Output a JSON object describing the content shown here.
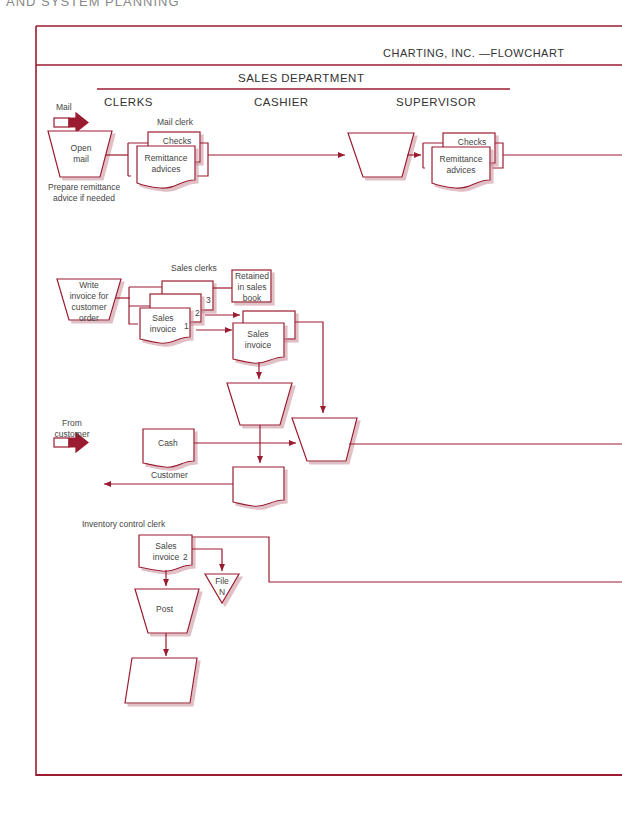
{
  "page_header_partial": "AND SYSTEM PLANNING",
  "title": "CHARTING, INC. —FLOWCHART",
  "department": "SALES DEPARTMENT",
  "lanes": [
    "CLERKS",
    "CASHIER",
    "SUPERVISOR"
  ],
  "colors": {
    "stroke": "#9b1b30",
    "arrow_fill": "#9b1b30",
    "text": "#444444",
    "shadow": "#d9b3bb"
  },
  "inputs": {
    "mail": "Mail",
    "from_customer_line1": "From",
    "from_customer_line2": "customer"
  },
  "mail_section": {
    "role": "Mail clerk",
    "open_mail_line1": "Open",
    "open_mail_line2": "mail",
    "note_line1": "Prepare remittance",
    "note_line2": "advice if needed",
    "doc_checks": "Checks",
    "doc_remittance_line1": "Remittance",
    "doc_remittance_line2": "advices",
    "supervisor_checks": "Checks",
    "supervisor_remittance_line1": "Remittance",
    "supervisor_remittance_line2": "advices"
  },
  "sales_section": {
    "role": "Sales clerks",
    "write_line1": "Write",
    "write_line2": "invoice for",
    "write_line3": "customer",
    "write_line4": "order",
    "retained_line1": "Retained",
    "retained_line2": "in sales",
    "retained_line3": "book",
    "invoice_line1": "Sales",
    "invoice_line2": "invoice",
    "copy1": "1",
    "copy2": "2",
    "copy3": "3",
    "cashier_invoice_line1": "Sales",
    "cashier_invoice_line2": "invoice",
    "cash": "Cash",
    "customer": "Customer"
  },
  "inventory_section": {
    "role": "Inventory control clerk",
    "invoice_line1": "Sales",
    "invoice_line2": "invoice",
    "copy": "2",
    "file_line1": "File",
    "file_line2": "N",
    "post": "Post"
  }
}
